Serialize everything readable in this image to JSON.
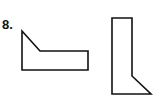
{
  "problem": {
    "number_label": "8."
  },
  "shapes": [
    {
      "name": "shape-a",
      "points": "22,31 40,51 88,51 88,70 22,70"
    },
    {
      "name": "shape-b",
      "points": "112,18 132,18 132,76 151,94 112,94"
    }
  ],
  "colors": {
    "stroke": "#111111",
    "background": "#ffffff"
  }
}
